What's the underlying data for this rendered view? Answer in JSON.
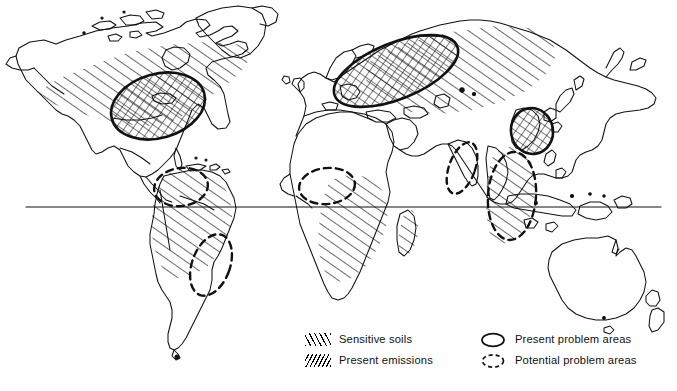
{
  "figure": {
    "background_color": "#fefefe",
    "ink_color": "#111111",
    "equator_label": "equator"
  },
  "legend": {
    "columns": [
      {
        "items": [
          {
            "id": "sensitive-soils",
            "label": "Sensitive soils",
            "symbol": "forward-hatch"
          },
          {
            "id": "present-emissions",
            "label": "Present emissions",
            "symbol": "backward-hatch"
          }
        ]
      },
      {
        "items": [
          {
            "id": "present-problem-areas",
            "label": "Present problem areas",
            "symbol": "solid-ellipse"
          },
          {
            "id": "potential-problem-areas",
            "label": "Potential problem areas",
            "symbol": "dashed-ellipse"
          }
        ]
      }
    ]
  },
  "map_features": {
    "continents": [
      "North America",
      "South America",
      "Greenland",
      "Europe",
      "Africa",
      "Asia",
      "Australia",
      "New Zealand"
    ],
    "sensitive_soil_regions": [
      "Canada and northern United States",
      "Amazon Basin and central South America",
      "Equatorial Africa and Madagascar",
      "Northern Europe and western Russia",
      "Southeast Asia"
    ],
    "present_emission_regions": [
      "Eastern United States and Great Lakes",
      "Northern and central Europe",
      "Eastern China, Korea and Japan"
    ],
    "present_problem_areas": [
      "Eastern North America",
      "Northern and Central Europe",
      "East Asia (eastern China / Korea)"
    ],
    "potential_problem_areas": [
      "Northern South America (Venezuela / Colombia)",
      "Southeastern Brazil",
      "West Africa (Nigeria region)",
      "Southwestern India",
      "Southeast Asia (Indochina / Indonesia)"
    ]
  }
}
